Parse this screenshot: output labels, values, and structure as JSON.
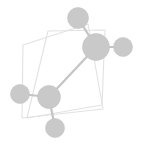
{
  "figure": {
    "width": 142,
    "height": 144,
    "background_color": "#ffffff"
  },
  "style": {
    "node_fill": "#c9c9c9",
    "node_stroke": "#c2c2c2",
    "edge_color": "#c4c4c4",
    "edge_width": 2.2,
    "polygon_stroke": "#e2e2e2",
    "polygon_fill": "none",
    "polygon_width": 1.1
  },
  "chart_data": {
    "type": "scatter",
    "title": "",
    "xlabel": "",
    "ylabel": "",
    "grid": false,
    "legend": null,
    "nodes": [
      {
        "id": "n-top",
        "label": "",
        "x": 78,
        "y": 18,
        "r": 10.5
      },
      {
        "id": "n-hub-upper",
        "label": "",
        "x": 96,
        "y": 47,
        "r": 13.5
      },
      {
        "id": "n-right",
        "label": "",
        "x": 123,
        "y": 47,
        "r": 9.5
      },
      {
        "id": "n-hub-lower",
        "label": "",
        "x": 49,
        "y": 97,
        "r": 11.5
      },
      {
        "id": "n-left",
        "label": "",
        "x": 20,
        "y": 94,
        "r": 9.5
      },
      {
        "id": "n-bottom",
        "label": "",
        "x": 55,
        "y": 128,
        "r": 9.5
      }
    ],
    "edges": [
      {
        "source": "n-top",
        "target": "n-hub-upper"
      },
      {
        "source": "n-hub-upper",
        "target": "n-right"
      },
      {
        "source": "n-hub-upper",
        "target": "n-hub-lower"
      },
      {
        "source": "n-hub-lower",
        "target": "n-left"
      },
      {
        "source": "n-hub-lower",
        "target": "n-bottom"
      }
    ],
    "polygons": [
      {
        "id": "quad-back",
        "points": "48,31 105,30 102,105 27,118"
      },
      {
        "id": "quad-front",
        "points": "23,45 88,24 103,109 22,118"
      }
    ]
  }
}
